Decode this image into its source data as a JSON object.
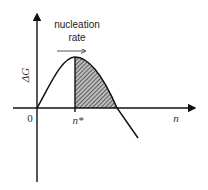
{
  "diagram": {
    "title": "",
    "y_axis_label": "ΔG",
    "x_axis_label": "n",
    "origin_label": "0",
    "critical_label": "n*",
    "annotation": {
      "line1": "nucleation",
      "line2": "rate",
      "arrow_direction": "right"
    },
    "curve": {
      "description": "Free energy ΔG vs cluster size n; rises from origin to maximum at n*, then falls below zero",
      "shaded_region": "hatched area under curve from n* to zero crossing"
    },
    "colors": {
      "stroke": "#111111",
      "hatch": "#333333",
      "background": "#ffffff"
    }
  }
}
